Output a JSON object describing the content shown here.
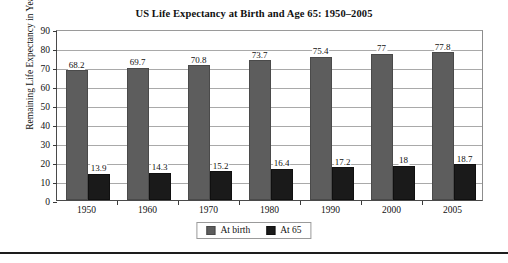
{
  "chart_data": {
    "type": "bar",
    "title": "US Life Expectancy at Birth and Age 65: 1950–2005",
    "xlabel": "",
    "ylabel": "Remaining Life Expectancy in Years",
    "categories": [
      "1950",
      "1960",
      "1970",
      "1980",
      "1990",
      "2000",
      "2005"
    ],
    "series": [
      {
        "name": "At birth",
        "color": "#5d5d5d",
        "values": [
          68.2,
          69.7,
          70.8,
          73.7,
          75.4,
          77,
          77.8
        ],
        "labels": [
          "68.2",
          "69.7",
          "70.8",
          "73.7",
          "75.4",
          "77",
          "77.8"
        ]
      },
      {
        "name": "At 65",
        "color": "#1a1a1a",
        "values": [
          13.9,
          14.3,
          15.2,
          16.4,
          17.2,
          18,
          18.7
        ],
        "labels": [
          "13.9",
          "14.3",
          "15.2",
          "16.4",
          "17.2",
          "18",
          "18.7"
        ]
      }
    ],
    "ylim": [
      0,
      90
    ],
    "yticks": [
      0,
      10,
      20,
      30,
      40,
      50,
      60,
      70,
      80,
      90
    ],
    "ytick_labels": [
      "0",
      "10",
      "20",
      "30",
      "40",
      "50",
      "60",
      "70",
      "80",
      "90"
    ],
    "grid": true,
    "legend_position": "bottom-center"
  }
}
